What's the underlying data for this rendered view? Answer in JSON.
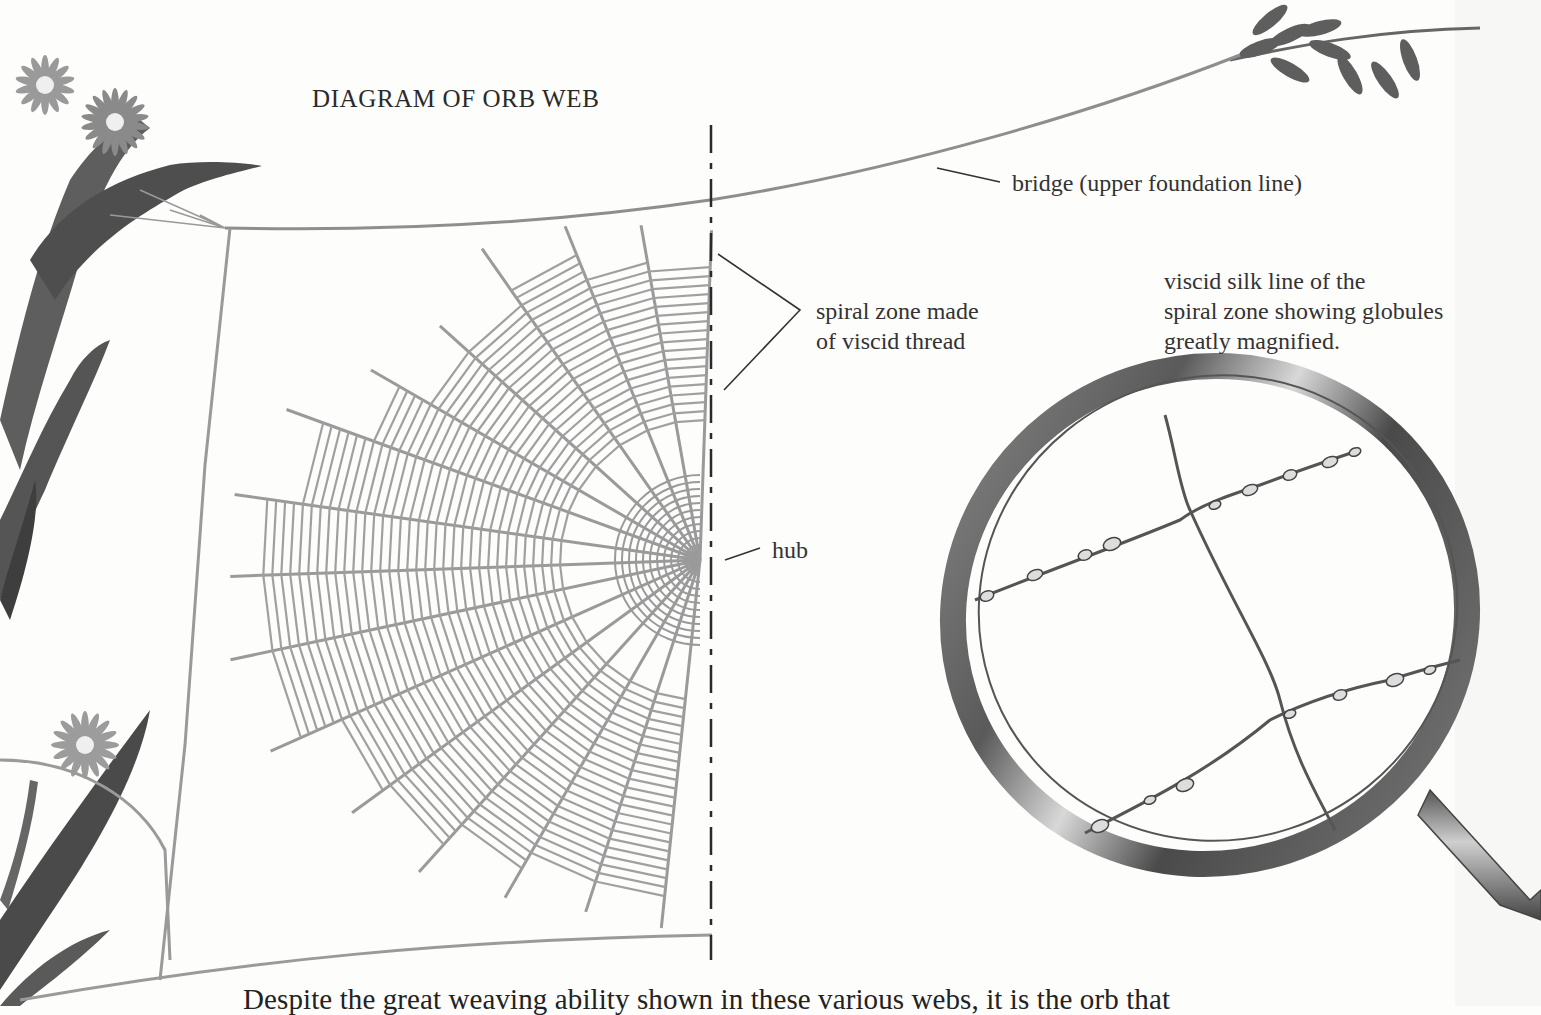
{
  "diagram": {
    "title": "DIAGRAM OF ORB WEB",
    "labels": {
      "bridge": "bridge (upper foundation line)",
      "spiral_zone": [
        "spiral zone made",
        "of viscid thread"
      ],
      "magnified": [
        "viscid silk line of the",
        "spiral zone showing globules",
        "greatly magnified."
      ],
      "hub": "hub"
    },
    "body_text": "Despite the great weaving ability shown in these various webs, it is the orb that",
    "components": [
      "bridge-thread",
      "frame-threads",
      "radial-threads",
      "spiral-zone",
      "hub",
      "center-dashed-line",
      "magnifying-glass",
      "flower-plant",
      "leaf-sprig"
    ],
    "colors": {
      "web": "#9a9a9a",
      "ink": "#2c2c2c",
      "plant": "#5a5a5a",
      "glass_rim": "#6e6e6e",
      "paper": "#fdfdfc"
    }
  }
}
